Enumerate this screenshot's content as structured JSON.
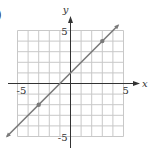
{
  "label": ")",
  "chart_data": {
    "type": "line",
    "title": "",
    "xlabel": "x",
    "ylabel": "y",
    "xlim": [
      -5,
      5
    ],
    "ylim": [
      -5,
      5
    ],
    "grid": true,
    "x_tick_labels": [
      "-5",
      "5"
    ],
    "y_tick_labels": [
      "5",
      "-5"
    ],
    "series": [
      {
        "name": "y = x + 1",
        "equation": "y = x + 1",
        "slope": 1,
        "intercept": 1,
        "x": [
          -6,
          4.5
        ],
        "y": [
          -5,
          5.5
        ],
        "color": "#7a7a7a"
      }
    ],
    "marked_points": [
      {
        "x": -3,
        "y": -2
      },
      {
        "x": 3,
        "y": 4
      }
    ]
  },
  "colors": {
    "grid": "#c8c8c8",
    "axis": "#333333",
    "line": "#7a7a7a",
    "text": "#333333"
  }
}
